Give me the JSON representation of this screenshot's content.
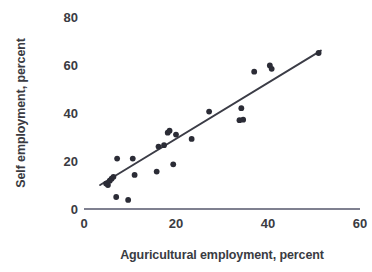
{
  "chart_data": {
    "type": "scatter",
    "title": "",
    "subtitle": "",
    "xlabel": "Aguricultural employment, percent",
    "ylabel": "Self employment, percent",
    "xlim": [
      0,
      60
    ],
    "ylim": [
      0,
      80
    ],
    "xticks": [
      0,
      20,
      40,
      60
    ],
    "yticks": [
      0,
      20,
      40,
      60,
      80
    ],
    "xtick_labels": [
      "0",
      "20",
      "40",
      "60"
    ],
    "ytick_labels": [
      "0",
      "20",
      "40",
      "60",
      "80"
    ],
    "grid": false,
    "legend": null,
    "legend_position": "none",
    "annotations": [],
    "marker": "filled-circle",
    "marker_color": "#2b2c36",
    "axis_color": "#55566b",
    "trendline": {
      "visible": true,
      "color": "#3b3c46",
      "x_start": 3.5,
      "y_start": 10.0,
      "x_end": 51.5,
      "y_end": 66.0
    },
    "x": [
      4.8,
      5.2,
      5.6,
      6.0,
      6.4,
      7.0,
      7.2,
      9.6,
      10.6,
      11.0,
      15.8,
      16.2,
      17.4,
      18.2,
      18.6,
      19.4,
      20.0,
      23.4,
      27.2,
      33.8,
      34.2,
      34.6,
      37.0,
      40.4,
      40.8,
      51.0
    ],
    "y": [
      10.6,
      10.0,
      11.8,
      12.6,
      13.4,
      5.0,
      21.0,
      3.8,
      21.0,
      14.2,
      15.6,
      26.0,
      26.6,
      31.8,
      32.6,
      18.6,
      31.0,
      29.2,
      40.6,
      37.0,
      42.0,
      37.2,
      57.2,
      59.8,
      58.4,
      65.0
    ],
    "points": [
      {
        "x": 4.8,
        "y": 10.6
      },
      {
        "x": 5.2,
        "y": 10.0
      },
      {
        "x": 5.6,
        "y": 11.8
      },
      {
        "x": 6.0,
        "y": 12.6
      },
      {
        "x": 6.4,
        "y": 13.4
      },
      {
        "x": 7.0,
        "y": 5.0
      },
      {
        "x": 7.2,
        "y": 21.0
      },
      {
        "x": 9.6,
        "y": 3.8
      },
      {
        "x": 10.6,
        "y": 21.0
      },
      {
        "x": 11.0,
        "y": 14.2
      },
      {
        "x": 15.8,
        "y": 15.6
      },
      {
        "x": 16.2,
        "y": 26.0
      },
      {
        "x": 17.4,
        "y": 26.6
      },
      {
        "x": 18.2,
        "y": 31.8
      },
      {
        "x": 18.6,
        "y": 32.6
      },
      {
        "x": 19.4,
        "y": 18.6
      },
      {
        "x": 20.0,
        "y": 31.0
      },
      {
        "x": 23.4,
        "y": 29.2
      },
      {
        "x": 27.2,
        "y": 40.6
      },
      {
        "x": 33.8,
        "y": 37.0
      },
      {
        "x": 34.2,
        "y": 42.0
      },
      {
        "x": 34.6,
        "y": 37.2
      },
      {
        "x": 37.0,
        "y": 57.2
      },
      {
        "x": 40.4,
        "y": 59.8
      },
      {
        "x": 40.8,
        "y": 58.4
      },
      {
        "x": 51.0,
        "y": 65.0
      }
    ]
  }
}
